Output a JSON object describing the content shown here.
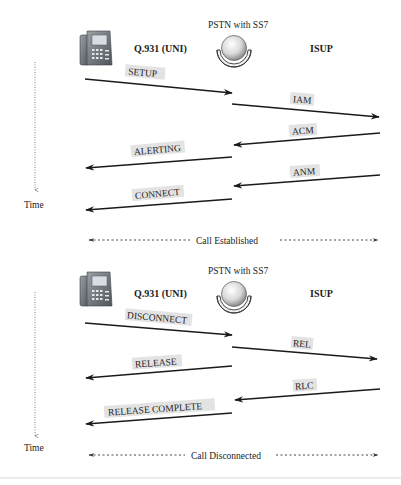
{
  "diagram": {
    "type": "sequence-diagram",
    "colors": {
      "line": "#1a1a1a",
      "label_bg": "#e3e3e3",
      "text": "#222222",
      "separator": "#e6e6e6"
    },
    "sections": [
      {
        "id": "setup",
        "phone_icon": "ip-phone-icon",
        "left_protocol": "Q.931 (UNI)",
        "network_label": "PSTN with SS7",
        "network_icon": "pstn-cloud-icon",
        "right_protocol": "ISUP",
        "time_label": "Time",
        "messages": [
          {
            "label": "SETUP",
            "direction": "right",
            "segment": "phone-to-pstn"
          },
          {
            "label": "IAM",
            "direction": "right",
            "segment": "pstn-to-far"
          },
          {
            "label": "ACM",
            "direction": "left",
            "segment": "far-to-pstn"
          },
          {
            "label": "ALERTING",
            "direction": "left",
            "segment": "pstn-to-phone"
          },
          {
            "label": "ANM",
            "direction": "left",
            "segment": "far-to-pstn"
          },
          {
            "label": "CONNECT",
            "direction": "left",
            "segment": "pstn-to-phone"
          }
        ],
        "status": "Call Established"
      },
      {
        "id": "teardown",
        "phone_icon": "ip-phone-icon",
        "left_protocol": "Q.931 (UNI)",
        "network_label": "PSTN with SS7",
        "network_icon": "pstn-cloud-icon",
        "right_protocol": "ISUP",
        "time_label": "Time",
        "messages": [
          {
            "label": "DISCONNECT",
            "direction": "right",
            "segment": "phone-to-pstn"
          },
          {
            "label": "REL",
            "direction": "right",
            "segment": "pstn-to-far"
          },
          {
            "label": "RELEASE",
            "direction": "left",
            "segment": "pstn-to-phone"
          },
          {
            "label": "RLC",
            "direction": "left",
            "segment": "far-to-pstn"
          },
          {
            "label": "RELEASE COMPLETE",
            "direction": "left",
            "segment": "pstn-to-phone"
          }
        ],
        "status": "Call Disconnected"
      }
    ]
  }
}
